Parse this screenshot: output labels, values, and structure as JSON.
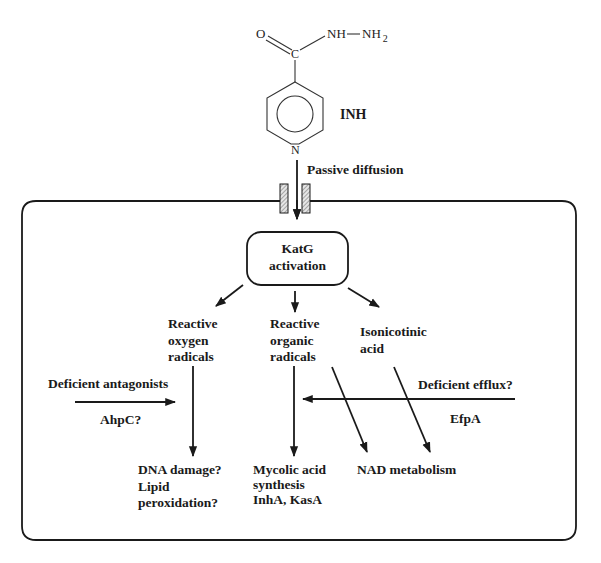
{
  "figure": {
    "molecule": {
      "name_label": "INH",
      "atom_O": "O",
      "atom_C": "C",
      "group_NH": "NH",
      "group_NH2": "NH",
      "group_NH2_subscript": "2",
      "atom_N": "N",
      "bond_dash": "—"
    },
    "entry": {
      "label": "Passive diffusion"
    },
    "activation": {
      "line1": "KatG",
      "line2": "activation"
    },
    "products": [
      {
        "id": "ros",
        "lines": [
          "Reactive",
          "oxygen",
          "radicals"
        ]
      },
      {
        "id": "ror",
        "lines": [
          "Reactive",
          "organic",
          "radicals"
        ]
      },
      {
        "id": "ina",
        "lines": [
          "Isonicotinic",
          "acid"
        ]
      }
    ],
    "modifiers": {
      "antagonists": {
        "label": "Deficient antagonists",
        "sublabel": "AhpC?"
      },
      "efflux": {
        "label": "Deficient efflux?",
        "sublabel": "EfpA"
      }
    },
    "outcomes": [
      {
        "id": "dna",
        "lines": [
          "DNA damage?",
          "Lipid",
          "peroxidation?"
        ]
      },
      {
        "id": "mycolic",
        "lines": [
          "Mycolic acid",
          "synthesis",
          "InhA, KasA"
        ]
      },
      {
        "id": "nad",
        "lines": [
          "NAD metabolism"
        ]
      }
    ],
    "colors": {
      "stroke": "#1a1a1a",
      "channel_fill": "#bdbdbd",
      "background": "#ffffff"
    }
  }
}
